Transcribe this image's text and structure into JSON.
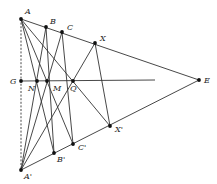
{
  "diagram": {
    "type": "geometric-construction",
    "points": [
      {
        "id": "A",
        "label": "A",
        "x": 21,
        "y": 19,
        "lx": 25,
        "ly": 14
      },
      {
        "id": "B",
        "label": "B",
        "x": 46,
        "y": 27,
        "lx": 50,
        "ly": 24
      },
      {
        "id": "C",
        "label": "C",
        "x": 62,
        "y": 32,
        "lx": 67,
        "ly": 30
      },
      {
        "id": "X",
        "label": "X",
        "x": 95,
        "y": 43,
        "lx": 100,
        "ly": 41
      },
      {
        "id": "E",
        "label": "E",
        "x": 199,
        "y": 80,
        "lx": 204,
        "ly": 83
      },
      {
        "id": "G",
        "label": "G",
        "x": 21,
        "y": 81,
        "lx": 10,
        "ly": 84
      },
      {
        "id": "N",
        "label": "N",
        "x": 37,
        "y": 81,
        "lx": 28,
        "ly": 91
      },
      {
        "id": "M",
        "label": "M",
        "x": 47,
        "y": 81,
        "lx": 53,
        "ly": 91
      },
      {
        "id": "Q",
        "label": "Q",
        "x": 73,
        "y": 81,
        "lx": 70,
        "ly": 91
      },
      {
        "id": "A'",
        "label": "A'",
        "x": 21,
        "y": 170,
        "lx": 24,
        "ly": 179
      },
      {
        "id": "B'",
        "label": "B'",
        "x": 54,
        "y": 153,
        "lx": 57,
        "ly": 162
      },
      {
        "id": "C'",
        "label": "C'",
        "x": 73,
        "y": 144,
        "lx": 78,
        "ly": 150
      },
      {
        "id": "X'",
        "label": "X'",
        "x": 110,
        "y": 126,
        "lx": 115,
        "ly": 132
      }
    ],
    "segments": [
      {
        "from": "A",
        "to": "E",
        "style": "solid"
      },
      {
        "from": "A'",
        "to": "E",
        "style": "solid"
      },
      {
        "from": "A",
        "to": "A'",
        "style": "dashed"
      },
      {
        "from": "G",
        "to": "END",
        "style": "solid"
      },
      {
        "from": "A",
        "to": "B'",
        "style": "solid"
      },
      {
        "from": "A",
        "to": "C'",
        "style": "solid"
      },
      {
        "from": "A",
        "to": "X'",
        "style": "solid"
      },
      {
        "from": "A'",
        "to": "B",
        "style": "solid"
      },
      {
        "from": "A'",
        "to": "C",
        "style": "solid"
      },
      {
        "from": "A'",
        "to": "X",
        "style": "solid"
      },
      {
        "from": "B",
        "to": "B'",
        "style": "solid"
      },
      {
        "from": "C",
        "to": "C'",
        "style": "solid"
      },
      {
        "from": "X",
        "to": "X'",
        "style": "solid"
      }
    ],
    "extra_points": {
      "END": {
        "x": 155,
        "y": 80
      }
    },
    "dotted_points": [
      "A",
      "B",
      "C",
      "X",
      "E",
      "G",
      "N",
      "M",
      "Q",
      "A'",
      "B'",
      "C'",
      "X'"
    ]
  }
}
